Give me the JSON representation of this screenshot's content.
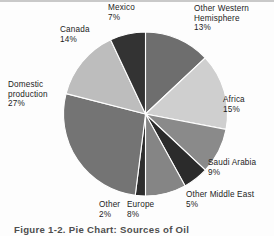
{
  "figure": {
    "caption": "Figure 1-2. Pie Chart: Sources of Oil",
    "background": "#fdfdfd"
  },
  "chart_data": {
    "type": "pie",
    "title": "Sources of Oil",
    "xlabel": "",
    "ylabel": "",
    "start_angle_deg": 0,
    "direction": "clockwise",
    "legend": "none",
    "grid": false,
    "labels_outside": true,
    "categories": [
      "Other Western Hemisphere",
      "Africa",
      "Saudi Arabia",
      "Other Middle East",
      "Europe",
      "Other",
      "Domestic production",
      "Canada",
      "Mexico"
    ],
    "values": [
      13,
      15,
      9,
      5,
      8,
      2,
      27,
      14,
      7
    ],
    "value_labels": [
      "13%",
      "15%",
      "9%",
      "5%",
      "8%",
      "2%",
      "27%",
      "14%",
      "7%"
    ],
    "colors": [
      "#6e6e6e",
      "#cfcfcf",
      "#8a8a8a",
      "#2b2b2b",
      "#858585",
      "#2e2e2e",
      "#747474",
      "#bdbdbd",
      "#333333"
    ],
    "slices": [
      {
        "name": "Other Western Hemisphere",
        "value": 13,
        "pct_label": "13%",
        "color": "#6e6e6e"
      },
      {
        "name": "Africa",
        "value": 15,
        "pct_label": "15%",
        "color": "#cfcfcf"
      },
      {
        "name": "Saudi Arabia",
        "value": 9,
        "pct_label": "9%",
        "color": "#8a8a8a"
      },
      {
        "name": "Other Middle East",
        "value": 5,
        "pct_label": "5%",
        "color": "#2b2b2b"
      },
      {
        "name": "Europe",
        "value": 8,
        "pct_label": "8%",
        "color": "#858585"
      },
      {
        "name": "Other",
        "value": 2,
        "pct_label": "2%",
        "color": "#2e2e2e"
      },
      {
        "name": "Domestic production",
        "value": 27,
        "pct_label": "27%",
        "color": "#747474"
      },
      {
        "name": "Canada",
        "value": 14,
        "pct_label": "14%",
        "color": "#bdbdbd"
      },
      {
        "name": "Mexico",
        "value": 7,
        "pct_label": "7%",
        "color": "#333333"
      }
    ]
  },
  "labels": {
    "mexico": {
      "name": "Mexico",
      "pct": "7%"
    },
    "owh": {
      "name_line1": "Other Western",
      "name_line2": "Hemisphere",
      "pct": "13%"
    },
    "canada": {
      "name": "Canada",
      "pct": "14%"
    },
    "domestic": {
      "name_line1": "Domestic",
      "name_line2": "production",
      "pct": "27%"
    },
    "africa": {
      "name": "Africa",
      "pct": "15%"
    },
    "saudi": {
      "name": "Saudi Arabia",
      "pct": "9%"
    },
    "ome": {
      "name": "Other Middle East",
      "pct": "5%"
    },
    "europe": {
      "name": "Europe",
      "pct": "8%"
    },
    "other": {
      "name": "Other",
      "pct": "2%"
    }
  }
}
